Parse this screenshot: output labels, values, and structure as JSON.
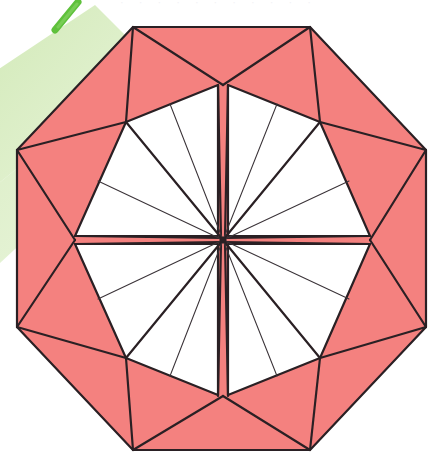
{
  "canvas": {
    "width": 431,
    "height": 455,
    "background": "#ffffff"
  },
  "figure": {
    "colors": {
      "fill_pink": "#F4817F",
      "fill_white": "#FFFFFF",
      "outline_dark": "#2A2024",
      "crease_thin": "#3A3338",
      "green_stroke": "#5FC13C",
      "green_wash": "#CDE7B0",
      "page_white": "#FFFFFF"
    },
    "center_point": {
      "x": 223,
      "y": 240,
      "label": "hub"
    },
    "spoke_count": 16,
    "petal_count": 8,
    "octagon_vertices": [
      {
        "x": 133,
        "y": 27
      },
      {
        "x": 310,
        "y": 27
      },
      {
        "x": 426,
        "y": 150
      },
      {
        "x": 426,
        "y": 327
      },
      {
        "x": 310,
        "y": 450
      },
      {
        "x": 133,
        "y": 450
      },
      {
        "x": 17,
        "y": 327
      },
      {
        "x": 17,
        "y": 150
      }
    ],
    "inner_star_vertices": [
      {
        "x": 223,
        "y": 83
      },
      {
        "x": 320,
        "y": 122
      },
      {
        "x": 370,
        "y": 240
      },
      {
        "x": 320,
        "y": 358
      },
      {
        "x": 223,
        "y": 397
      },
      {
        "x": 126,
        "y": 358
      },
      {
        "x": 75,
        "y": 240
      },
      {
        "x": 126,
        "y": 122
      }
    ],
    "annotations": {
      "green_marker": "diagonal green brush stroke, upper left",
      "green_wash_band": "pale green diagonal band, left edge",
      "top_smudge": "faint grey residual marks along top trim edge"
    }
  },
  "smudge": {
    "text": "· · ·   · · ·   · ·   · · ·"
  }
}
